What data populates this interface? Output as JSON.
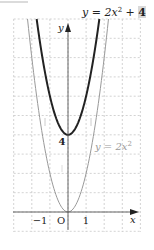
{
  "chart_data": {
    "type": "line",
    "xlabel": "x",
    "ylabel": "y",
    "xlim": [
      -3,
      4
    ],
    "ylim": [
      -1,
      10
    ],
    "grid": true,
    "grid_style": "dashed",
    "x_tick_labels": [
      {
        "value": -1,
        "label": "−1"
      },
      {
        "value": 0,
        "label": "O"
      },
      {
        "value": 1,
        "label": "1"
      }
    ],
    "y_tick_labels": [
      {
        "value": 4,
        "label": "4"
      }
    ],
    "series": [
      {
        "name": "y = 2x² + 4",
        "expression": "2x^2+4",
        "color": "#222222",
        "stroke_width": 2,
        "vertex": [
          0,
          4
        ]
      },
      {
        "name": "y = 2x²",
        "expression": "2x^2",
        "color": "#999999",
        "stroke_width": 1,
        "vertex": [
          0,
          0
        ]
      }
    ],
    "annotations": [
      {
        "text": "y = 2x² + 4",
        "position": "top-right",
        "highlight_term": "4"
      },
      {
        "text": "y = 2x²",
        "position": [
          1.1,
          3.5
        ]
      },
      {
        "text": "4",
        "position": [
          -0.4,
          3.6
        ],
        "bold": true
      }
    ]
  },
  "labels": {
    "title_prefix": "y = 2x",
    "title_sup": "2",
    "title_plus": " + ",
    "title_const": "4",
    "curve2_prefix": "y = 2x",
    "curve2_sup": "2",
    "y_axis": "y",
    "x_axis": "x",
    "tick_neg1": "−1",
    "tick_origin": "O",
    "tick_1": "1",
    "tick_4": "4"
  },
  "colors": {
    "grid": "#c8c8c8",
    "axis": "#333333",
    "curve_main": "#222222",
    "curve_base": "#9a9a9a",
    "highlight_bg": "#d9d9d9",
    "text": "#222222",
    "text_light": "#9a9a9a"
  }
}
